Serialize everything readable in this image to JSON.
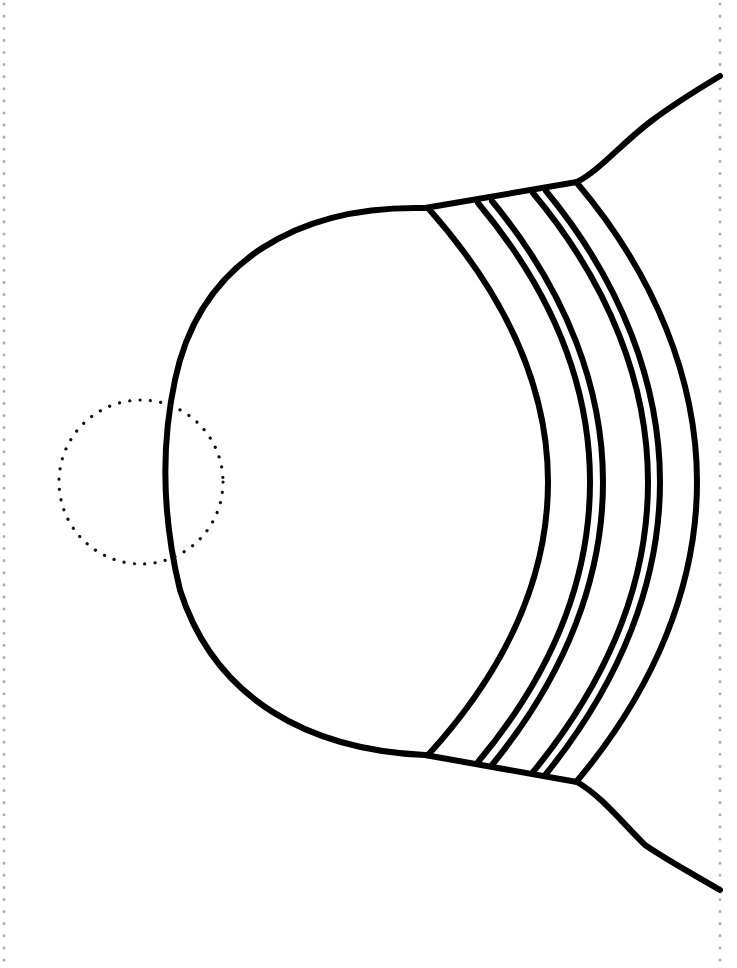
{
  "page": {
    "type": "coloring-page line drawing",
    "width": 737,
    "height": 968,
    "background": "#ffffff"
  },
  "colors": {
    "stroke": "#000000",
    "border_dots": "#b0b0b0",
    "guide_dots": "#111111"
  },
  "drawing": {
    "subject": "dome-shaped object with curved bands",
    "band_count": 5,
    "guide_circle": "dotted circle on left edge of dome"
  }
}
